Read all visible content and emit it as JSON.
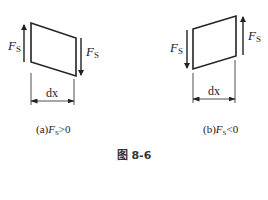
{
  "figure": {
    "caption": "图 8-6",
    "panels": [
      {
        "id": "a",
        "caption_prefix": "(a)",
        "force_symbol": "F",
        "force_subscript": "S",
        "relation": ">",
        "value": "0",
        "left_force_label": "F",
        "left_force_sub": "S",
        "left_force_direction": "up",
        "right_force_label": "F",
        "right_force_sub": "S",
        "right_force_direction": "down",
        "dimension_label": "dx"
      },
      {
        "id": "b",
        "caption_prefix": "(b)",
        "force_symbol": "F",
        "force_subscript": "S",
        "relation": "<",
        "value": "0",
        "left_force_label": "F",
        "left_force_sub": "S",
        "left_force_direction": "down",
        "right_force_label": "F",
        "right_force_sub": "S",
        "right_force_direction": "up",
        "dimension_label": "dx"
      }
    ]
  },
  "colors": {
    "stroke": "#222222",
    "background": "#ffffff"
  }
}
